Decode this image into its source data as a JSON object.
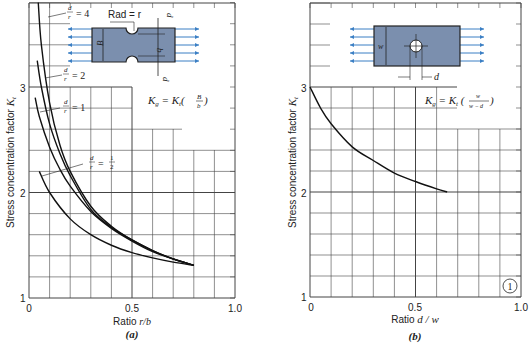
{
  "chart_data": [
    {
      "type": "line",
      "panel": "(a)",
      "title": "",
      "xlabel": "Ratio r/b",
      "ylabel": "Stress concentration factor K_t",
      "xlim": [
        0,
        1.0
      ],
      "ylim": [
        1,
        3.8
      ],
      "xticks": [
        "0",
        "0.5",
        "1.0"
      ],
      "yticks": [
        "1",
        "2",
        "3"
      ],
      "grid": true,
      "formula": "K_g = K_t (B/b)",
      "diagram_labels": [
        "Rad = r",
        "B",
        "b",
        "d",
        "d"
      ],
      "series": [
        {
          "name": "d/r = 4",
          "x": [
            0.045,
            0.06,
            0.1,
            0.15,
            0.2,
            0.3,
            0.4,
            0.5,
            0.6,
            0.7,
            0.8
          ],
          "y": [
            3.8,
            3.4,
            2.85,
            2.45,
            2.2,
            1.87,
            1.68,
            1.55,
            1.45,
            1.37,
            1.31
          ]
        },
        {
          "name": "d/r = 2",
          "x": [
            0.04,
            0.06,
            0.1,
            0.15,
            0.2,
            0.3,
            0.4,
            0.5,
            0.6,
            0.7,
            0.8
          ],
          "y": [
            3.25,
            3.0,
            2.65,
            2.37,
            2.16,
            1.84,
            1.67,
            1.55,
            1.45,
            1.37,
            1.31
          ]
        },
        {
          "name": "d/r = 1",
          "x": [
            0.03,
            0.05,
            0.1,
            0.15,
            0.2,
            0.3,
            0.4,
            0.5,
            0.6,
            0.7,
            0.8
          ],
          "y": [
            2.9,
            2.72,
            2.43,
            2.22,
            2.06,
            1.82,
            1.66,
            1.54,
            1.44,
            1.37,
            1.31
          ]
        },
        {
          "name": "d/r = 1/2",
          "x": [
            0.05,
            0.1,
            0.2,
            0.3,
            0.4,
            0.5,
            0.6,
            0.7,
            0.8
          ],
          "y": [
            2.2,
            2.0,
            1.75,
            1.6,
            1.5,
            1.43,
            1.38,
            1.34,
            1.31
          ]
        }
      ]
    },
    {
      "type": "line",
      "panel": "(b)",
      "title": "",
      "xlabel": "Ratio d/w",
      "ylabel": "Stress concentration factor K_t",
      "xlim": [
        0,
        1.0
      ],
      "ylim": [
        1,
        3.8
      ],
      "xticks": [
        "0",
        "0.5",
        "1.0"
      ],
      "yticks": [
        "1",
        "2",
        "3"
      ],
      "grid": true,
      "formula": "K_g = K_t (w/(w - d))",
      "diagram_labels": [
        "w",
        "d"
      ],
      "annotation": "1",
      "series": [
        {
          "name": "K_t",
          "x": [
            0,
            0.05,
            0.1,
            0.2,
            0.3,
            0.4,
            0.5,
            0.6,
            0.65
          ],
          "y": [
            3.0,
            2.8,
            2.65,
            2.43,
            2.3,
            2.18,
            2.1,
            2.03,
            2.0
          ]
        }
      ]
    }
  ],
  "panel_a": {
    "caption": "(a)",
    "xlabel_prefix": "Ratio ",
    "xlabel_var": "r/b",
    "ylabel": "Stress concentration factor ",
    "ylabel_var": "K",
    "ylabel_sub": "t",
    "xticks": [
      "0",
      "0.5",
      "1.0"
    ],
    "yticks": [
      "1",
      "2",
      "3"
    ],
    "labels": {
      "dr4": "= 4",
      "dr2": "= 2",
      "dr1": "= 1",
      "drhalf": "="
    },
    "rad_label": "Rad = r",
    "formula_lhs": "K",
    "formula_sub_g": "g",
    "formula_eq": " = K",
    "formula_sub_t": "t",
    "formula_num": "B",
    "formula_den": "b"
  },
  "panel_b": {
    "caption": "(b)",
    "xlabel_prefix": "Ratio ",
    "xlabel_var": "d / w",
    "ylabel": "Stress concentration factor ",
    "ylabel_var": "K",
    "ylabel_sub": "t",
    "xticks": [
      "0",
      "0.5",
      "1.0"
    ],
    "yticks": [
      "1",
      "2",
      "3"
    ],
    "d_label": "d",
    "w_label": "w",
    "formula_num": "w",
    "formula_den": "w − d",
    "badge": "1"
  },
  "colors": {
    "plate": "#7b8fae",
    "arrow": "#3b7fc4",
    "line": "#111111",
    "grid": "#444444"
  }
}
